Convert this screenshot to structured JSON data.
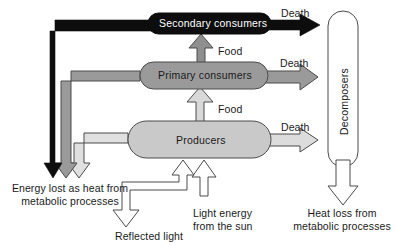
{
  "diagram": {
    "type": "flow-diagram",
    "colors": {
      "secondary_consumers_fill": "#0d0d0d",
      "primary_consumers_fill": "#9a9a9a",
      "producers_fill": "#c9c9c9",
      "decomposers_fill": "#ffffff",
      "outline": "#4a4a4a",
      "text_dark": "#1a1a1a",
      "text_light": "#ffffff",
      "background": "#ffffff"
    },
    "nodes": {
      "secondary_consumers": "Secondary consumers",
      "primary_consumers": "Primary consumers",
      "producers": "Producers",
      "decomposers": "Decomposers"
    },
    "flow_labels": {
      "food_to_secondary": "Food",
      "food_to_primary": "Food",
      "death_secondary": "Death",
      "death_primary": "Death",
      "death_producers": "Death"
    },
    "annotations": {
      "heat_left_line1": "Energy lost as heat from",
      "heat_left_line2": "metabolic processes",
      "reflected_light": "Reflected light",
      "light_energy_line1": "Light energy",
      "light_energy_line2": "from the sun",
      "heat_right_line1": "Heat loss from",
      "heat_right_line2": "metabolic processes"
    }
  }
}
